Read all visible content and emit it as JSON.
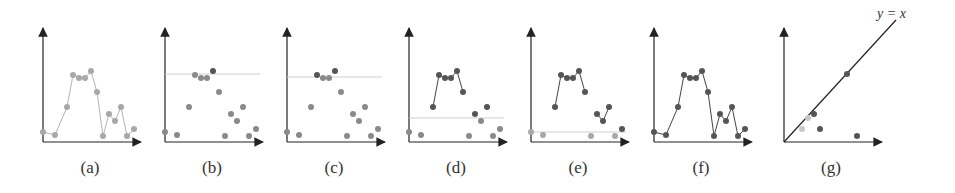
{
  "figure": {
    "panels": [
      {
        "id": "a",
        "caption": "(a)",
        "origin_x": 43,
        "variant": "raw"
      },
      {
        "id": "b",
        "caption": "(b)",
        "origin_x": 165,
        "variant": "threshold",
        "threshold_y": 74
      },
      {
        "id": "c",
        "caption": "(c)",
        "origin_x": 287,
        "variant": "threshold",
        "threshold_y": 77
      },
      {
        "id": "d",
        "caption": "(d)",
        "origin_x": 409,
        "variant": "threshold",
        "threshold_y": 118
      },
      {
        "id": "e",
        "caption": "(e)",
        "origin_x": 531,
        "variant": "threshold",
        "threshold_y": 132
      },
      {
        "id": "f",
        "caption": "(f)",
        "origin_x": 654,
        "variant": "all"
      },
      {
        "id": "g",
        "caption": "(g)",
        "origin_x": 784,
        "variant": "diagonal"
      }
    ],
    "diagonal_label": "y = x",
    "colors": {
      "axis": "#222222",
      "light_point": "#a8a8a8",
      "mid_point": "#8a8a8a",
      "dark_point": "#555555",
      "light_line": "#b5b5b5",
      "dark_line": "#444444",
      "threshold_line": "#cfcfcf",
      "faint_point": "#cfcfcf"
    }
  },
  "chart_data": {
    "type": "line",
    "title": "",
    "xlabel": "",
    "ylabel": "",
    "series": [
      {
        "name": "signal",
        "x": [
          0,
          12,
          24,
          30,
          36,
          42,
          48,
          54,
          60,
          66,
          72,
          78,
          84,
          91
        ],
        "y": [
          10,
          7,
          35,
          67,
          64,
          64,
          71,
          50,
          6,
          28,
          21,
          35,
          6,
          13
        ]
      }
    ],
    "panels": [
      "(a) raw signal",
      "(b) threshold high",
      "(c) threshold slightly lower",
      "(d) threshold mid",
      "(e) threshold low",
      "(f) all connected",
      "(g) persistence diagram vs y = x"
    ],
    "diagonal_points": [
      {
        "birth": 18,
        "death": 13,
        "shade": "light"
      },
      {
        "birth": 24,
        "death": 24,
        "shade": "light"
      },
      {
        "birth": 30,
        "death": 28,
        "shade": "dark"
      },
      {
        "birth": 36,
        "death": 13,
        "shade": "dark"
      },
      {
        "birth": 63,
        "death": 68,
        "shade": "dark"
      },
      {
        "birth": 73,
        "death": 6,
        "shade": "dark"
      }
    ]
  }
}
